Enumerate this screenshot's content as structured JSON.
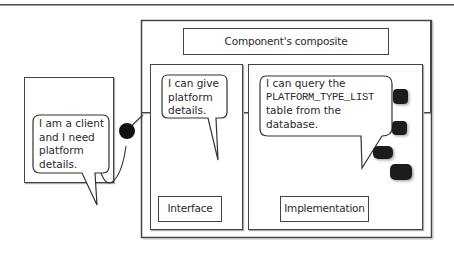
{
  "diagram": {
    "title": "Component's composite",
    "client": {
      "speech": [
        "I am a client",
        "and I need",
        "platform",
        "details."
      ]
    },
    "interface": {
      "label": "Interface",
      "speech": [
        "I can give",
        "platform",
        "details."
      ]
    },
    "implementation": {
      "label": "Implementation",
      "speech_line1": "I can query the",
      "speech_table": "PLATFORM_TYPE_LIST",
      "speech_line3": "table from the",
      "speech_line4": "database."
    },
    "connector": {
      "type": "ball-and-socket",
      "from": "client",
      "to": "component-composite"
    },
    "database_icons": 4,
    "colors": {
      "stroke": "#444444",
      "fill": "#ffffff",
      "db_fill": "#1a1a1a",
      "text": "#2a2a2a"
    }
  }
}
